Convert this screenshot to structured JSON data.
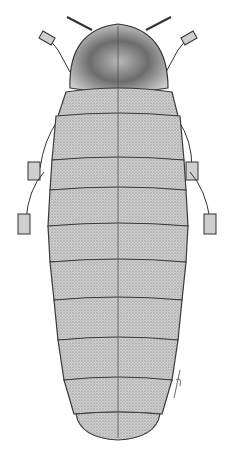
{
  "image": {
    "subject": "firefly larva (dorsal view), stipple illustration",
    "background": "#ffffff",
    "body_fill": "#c8c8c8",
    "shade_fill": "#8a8a8a",
    "outline": "#3a3a3a",
    "signature": "artist signature (illegible)"
  }
}
